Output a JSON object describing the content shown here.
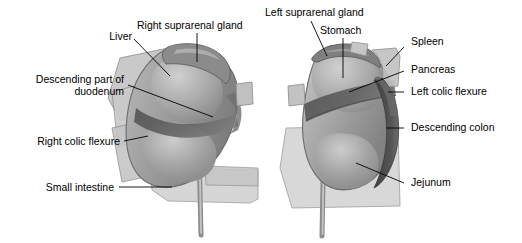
{
  "figure": {
    "type": "anatomical-diagram",
    "background_color": "#ffffff",
    "ink_color": "#000000",
    "panels": [
      {
        "id": "right-kidney",
        "name": "Right kidney anterior relations",
        "side": "left-of-image"
      },
      {
        "id": "left-kidney",
        "name": "Left kidney anterior relations",
        "side": "right-of-image"
      }
    ]
  },
  "labels": {
    "right_panel": {
      "liver": "Liver",
      "right_suprarenal_gland": "Right suprarenal gland",
      "descending_part_of_duodenum": "Descending part of duodenum",
      "right_colic_flexure": "Right colic flexure",
      "small_intestine": "Small intestine"
    },
    "left_panel": {
      "left_suprarenal_gland": "Left suprarenal gland",
      "stomach": "Stomach",
      "spleen": "Spleen",
      "pancreas": "Pancreas",
      "left_colic_flexure": "Left colic flexure",
      "descending_colon": "Descending colon",
      "jejunum": "Jejunum"
    }
  },
  "palette": {
    "organ_mid": "#9a9a9a",
    "organ_light": "#c9c9c9",
    "organ_dark": "#6e6e6e",
    "organ_darkest": "#4a4a4a",
    "outline": "#5a5a5a",
    "text": "#000000"
  }
}
